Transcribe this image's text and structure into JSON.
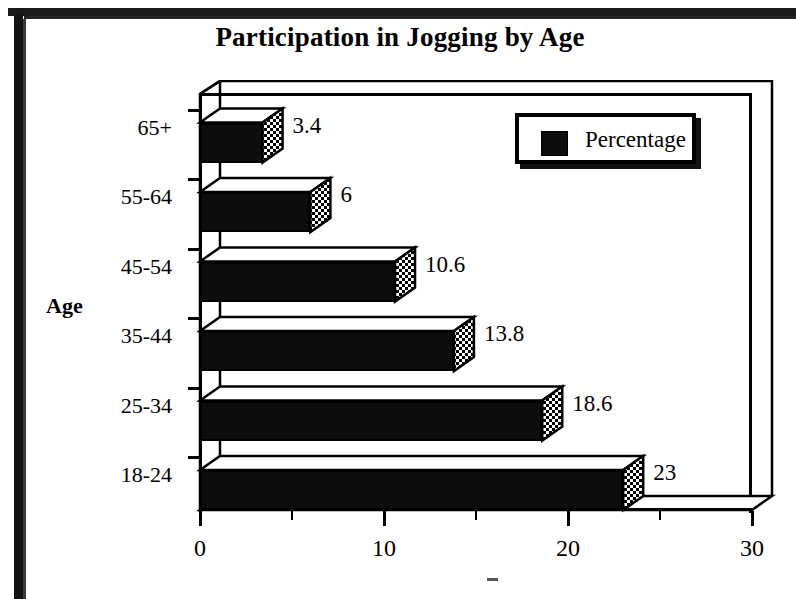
{
  "chart_data": {
    "type": "bar",
    "orientation": "horizontal",
    "style": "3d",
    "title": "Participation in Jogging by Age",
    "xlabel": "",
    "ylabel": "Age",
    "categories": [
      "18-24",
      "25-34",
      "35-44",
      "45-54",
      "55-64",
      "65+"
    ],
    "values": [
      23,
      18.6,
      13.8,
      10.6,
      6,
      3.4
    ],
    "data_labels": [
      "23",
      "18.6",
      "13.8",
      "10.6",
      "6",
      "3.4"
    ],
    "series": [
      {
        "name": "Percentage",
        "values": [
          23,
          18.6,
          13.8,
          10.6,
          6,
          3.4
        ],
        "color": "#0d0d0d"
      }
    ],
    "xlim": [
      0,
      30
    ],
    "xticks": [
      0,
      10,
      20,
      30
    ],
    "xtick_labels": [
      "0",
      "10",
      "20",
      "30"
    ],
    "xminor_ticks": [
      5,
      15,
      25
    ],
    "grid": false,
    "legend": {
      "position": "top-right",
      "entries": [
        "Percentage"
      ]
    }
  },
  "chart": {
    "title": "Participation in Jogging by Age",
    "axis_title_y": "Age",
    "legend_label": "Percentage",
    "legend_swatch_color": "#0d0d0d",
    "categories": [
      {
        "label": "65+",
        "value": 3.4,
        "data_label": "3.4"
      },
      {
        "label": "55-64",
        "value": 6,
        "data_label": "6"
      },
      {
        "label": "45-54",
        "value": 10.6,
        "data_label": "10.6"
      },
      {
        "label": "35-44",
        "value": 13.8,
        "data_label": "13.8"
      },
      {
        "label": "25-34",
        "value": 18.6,
        "data_label": "18.6"
      },
      {
        "label": "18-24",
        "value": 23,
        "data_label": "23"
      }
    ],
    "xticks": [
      {
        "label": "0",
        "value": 0
      },
      {
        "label": "10",
        "value": 10
      },
      {
        "label": "20",
        "value": 20
      },
      {
        "label": "30",
        "value": 30
      }
    ]
  }
}
